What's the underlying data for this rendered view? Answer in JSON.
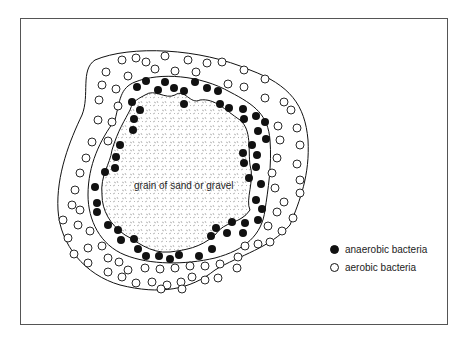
{
  "diagram": {
    "grain_label": "grain of sand or gravel",
    "legend": [
      {
        "symbol": "filled-circle",
        "label": "anaerobic bacteria"
      },
      {
        "symbol": "open-circle",
        "label": "aerobic bacteria"
      }
    ],
    "colors": {
      "line": "#111111",
      "background": "#ffffff",
      "grain_texture": "#888888"
    }
  }
}
